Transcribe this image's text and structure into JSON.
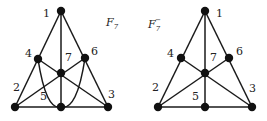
{
  "diagrams": [
    {
      "id": "F7",
      "title": "F",
      "title_sub": "7",
      "title_sup": "",
      "title_pos": [
        106,
        26
      ],
      "nodes": [
        {
          "label": "1",
          "x": 61,
          "y": 11,
          "lx": 43,
          "ly": 17
        },
        {
          "label": "4",
          "x": 38,
          "y": 59,
          "lx": 25,
          "ly": 57
        },
        {
          "label": "6",
          "x": 85,
          "y": 58,
          "lx": 91,
          "ly": 55
        },
        {
          "label": "7",
          "x": 61,
          "y": 73,
          "lx": 65,
          "ly": 61
        },
        {
          "label": "2",
          "x": 15,
          "y": 107,
          "lx": 13,
          "ly": 91
        },
        {
          "label": "5",
          "x": 61,
          "y": 107,
          "lx": 40,
          "ly": 100
        },
        {
          "label": "3",
          "x": 108,
          "y": 107,
          "lx": 108,
          "ly": 98
        }
      ],
      "has_circle_line": true
    },
    {
      "id": "F7-minus",
      "title": "F",
      "title_sub": "7",
      "title_sup": "−",
      "title_pos": [
        148,
        28
      ],
      "nodes": [
        {
          "label": "1",
          "x": 205,
          "y": 11,
          "lx": 216,
          "ly": 17
        },
        {
          "label": "4",
          "x": 181,
          "y": 58,
          "lx": 167,
          "ly": 57
        },
        {
          "label": "6",
          "x": 229,
          "y": 58,
          "lx": 236,
          "ly": 55
        },
        {
          "label": "7",
          "x": 205,
          "y": 73,
          "lx": 210,
          "ly": 61
        },
        {
          "label": "2",
          "x": 158,
          "y": 107,
          "lx": 152,
          "ly": 91
        },
        {
          "label": "5",
          "x": 205,
          "y": 107,
          "lx": 192,
          "ly": 100
        },
        {
          "label": "3",
          "x": 252,
          "y": 107,
          "lx": 249,
          "ly": 92
        }
      ],
      "has_circle_line": false
    }
  ]
}
